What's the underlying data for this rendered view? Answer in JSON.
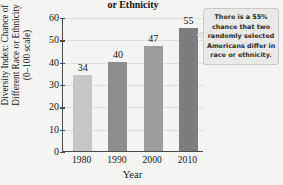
{
  "chart_data": {
    "type": "bar",
    "title": "or Ethnicity",
    "title_note": "Title is cropped at the top edge of the screenshot; only the final line is visible.",
    "xlabel": "Year",
    "ylabel": "Diversity Index: Chance of Different Race or Ethnicity (0–100 scale)",
    "ylabel_lines": [
      "Diversity Index: Chance of",
      "Different Race or Ethnicity",
      "(0–100 scale)"
    ],
    "categories": [
      "1980",
      "1990",
      "2000",
      "2010"
    ],
    "values": [
      34,
      40,
      47,
      55
    ],
    "value_labels": [
      "34",
      "40",
      "47",
      "55"
    ],
    "ylim": [
      0,
      60
    ],
    "ytick_values": [
      0,
      10,
      20,
      30,
      40,
      50,
      60
    ],
    "ytick_labels": [
      "0",
      "10",
      "20",
      "30",
      "40",
      "50",
      "60"
    ],
    "grid": true,
    "grid_axis": "y",
    "legend": "none",
    "bar_colors": [
      "#c6c6c6",
      "#8d8d8d",
      "#9c9c9c",
      "#7d7d7d"
    ],
    "axis_color": "#4a4a4a",
    "grid_color": "#dedede",
    "background_color": "#f4f4f2",
    "annotations": [
      {
        "name": "callout",
        "text": "There is a 55% chance that two randomly selected Americans differ in race or ethnicity.",
        "lines": [
          "There is a 55%",
          "chance that two",
          "randomly selected",
          "Americans differ in",
          "race or ethnicity."
        ],
        "points_at_category": "2010",
        "background_color": "#e9e9e7",
        "border_color": "#c9c9c5"
      }
    ]
  }
}
